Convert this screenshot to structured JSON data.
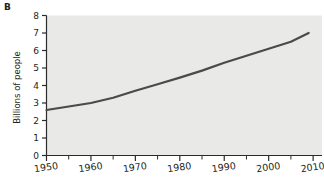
{
  "panel": {
    "label": "B"
  },
  "chart_data": {
    "type": "line",
    "title": "",
    "subtitle": "",
    "xlabel": "",
    "ylabel": "Billions of people",
    "xlim": [
      1950,
      2012
    ],
    "ylim": [
      0,
      8
    ],
    "grid": false,
    "legend": "none",
    "plot_background": "#e9e9e7",
    "line_color": "#4a4a4a",
    "x_ticks": [
      1950,
      1960,
      1970,
      1980,
      1990,
      2000,
      2010
    ],
    "x_tick_labels": [
      "1950",
      "1960",
      "1970",
      "1980",
      "1990",
      "2000",
      "2010"
    ],
    "x_minor_ticks": [
      1955,
      1965,
      1975,
      1985,
      1995,
      2005
    ],
    "y_ticks": [
      0,
      1,
      2,
      3,
      4,
      5,
      6,
      7,
      8
    ],
    "y_tick_labels": [
      "0",
      "1",
      "2",
      "3",
      "4",
      "5",
      "6",
      "7",
      "8"
    ],
    "series": [
      {
        "name": "World population",
        "x": [
          1950,
          1955,
          1960,
          1965,
          1970,
          1975,
          1980,
          1985,
          1990,
          1995,
          2000,
          2005,
          2009
        ],
        "values": [
          2.6,
          2.8,
          3.0,
          3.3,
          3.7,
          4.07,
          4.45,
          4.85,
          5.3,
          5.7,
          6.1,
          6.5,
          7.0
        ]
      }
    ]
  }
}
